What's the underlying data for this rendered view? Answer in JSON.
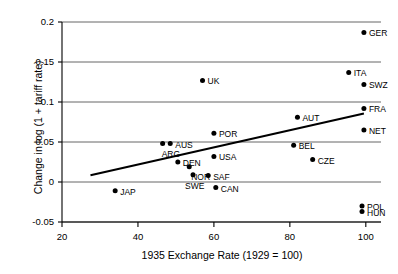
{
  "chart_data": {
    "type": "scatter",
    "title": "",
    "xlabel": "1935 Exchange Rate (1929 = 100)",
    "ylabel": "Change in log (1 + tariff rate)",
    "xlim": [
      20,
      104
    ],
    "ylim": [
      -0.05,
      0.2
    ],
    "xticks": [
      "20",
      "40",
      "60",
      "80",
      "100"
    ],
    "xtick_values": [
      20,
      40,
      60,
      80,
      100
    ],
    "yticks": [
      "0.2",
      "0.15",
      "0.1",
      "0.05",
      "0",
      "-0.05"
    ],
    "ytick_values": [
      0.2,
      0.15,
      0.1,
      0.05,
      0,
      -0.05
    ],
    "grid": "horizontal",
    "legend": "none",
    "points": [
      {
        "label": "GER",
        "x": 99.5,
        "y": 0.187,
        "label_dx": 5,
        "label_dy": 3
      },
      {
        "label": "ITA",
        "x": 95.5,
        "y": 0.137,
        "label_dx": 5,
        "label_dy": 3
      },
      {
        "label": "SWZ",
        "x": 99.5,
        "y": 0.122,
        "label_dx": 5,
        "label_dy": 3
      },
      {
        "label": "UK",
        "x": 57.0,
        "y": 0.127,
        "label_dx": 5,
        "label_dy": 3
      },
      {
        "label": "FRA",
        "x": 99.5,
        "y": 0.092,
        "label_dx": 5,
        "label_dy": 3
      },
      {
        "label": "AUT",
        "x": 82.0,
        "y": 0.081,
        "label_dx": 5,
        "label_dy": 3
      },
      {
        "label": "NET",
        "x": 99.5,
        "y": 0.065,
        "label_dx": 5,
        "label_dy": 3
      },
      {
        "label": "POR",
        "x": 60.0,
        "y": 0.061,
        "label_dx": 5,
        "label_dy": 3
      },
      {
        "label": "AUS",
        "x": 48.5,
        "y": 0.048,
        "label_dx": 5,
        "label_dy": 3
      },
      {
        "label": "ARG",
        "x": 46.5,
        "y": 0.048,
        "label_dx": -1,
        "label_dy": 12
      },
      {
        "label": "BEL",
        "x": 81.0,
        "y": 0.046,
        "label_dx": 5,
        "label_dy": 3
      },
      {
        "label": "USA",
        "x": 60.0,
        "y": 0.032,
        "label_dx": 5,
        "label_dy": 3
      },
      {
        "label": "DEN",
        "x": 50.5,
        "y": 0.025,
        "label_dx": 5,
        "label_dy": 3
      },
      {
        "label": "CZE",
        "x": 86.0,
        "y": 0.028,
        "label_dx": 5,
        "label_dy": 3
      },
      {
        "label": "NOR",
        "x": 53.5,
        "y": 0.019,
        "label_dx": 2,
        "label_dy": 12
      },
      {
        "label": "SAF",
        "x": 58.5,
        "y": 0.008,
        "label_dx": 5,
        "label_dy": 3
      },
      {
        "label": "SWE",
        "x": 54.5,
        "y": 0.009,
        "label_dx": -8,
        "label_dy": 13
      },
      {
        "label": "CAN",
        "x": 60.5,
        "y": -0.007,
        "label_dx": 5,
        "label_dy": 3
      },
      {
        "label": "JAP",
        "x": 34.0,
        "y": -0.011,
        "label_dx": 5,
        "label_dy": 3
      },
      {
        "label": "POL",
        "x": 99.0,
        "y": -0.03,
        "label_dx": 5,
        "label_dy": 3
      },
      {
        "label": "HUN",
        "x": 99.0,
        "y": -0.037,
        "label_dx": 5,
        "label_dy": 3
      }
    ],
    "trendline": {
      "x0": 27.5,
      "y0": 0.0085,
      "x1": 99.5,
      "y1": 0.0855
    }
  }
}
